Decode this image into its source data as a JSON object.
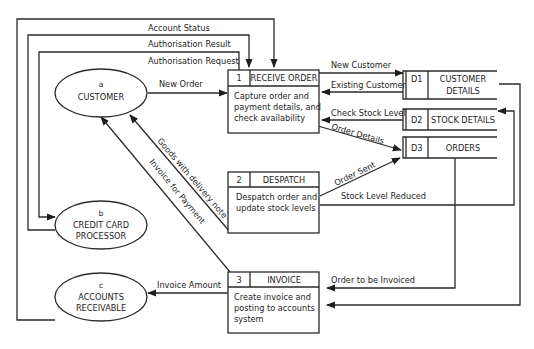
{
  "diagram": {
    "type": "data-flow-diagram",
    "external_entities": [
      {
        "id": "a",
        "name": "CUSTOMER"
      },
      {
        "id": "b",
        "name_line1": "CREDIT CARD",
        "name_line2": "PROCESSOR"
      },
      {
        "id": "c",
        "name_line1": "ACCOUNTS",
        "name_line2": "RECEIVABLE"
      }
    ],
    "processes": [
      {
        "number": "1",
        "name": "RECEIVE ORDER",
        "desc_line1": "Capture order and",
        "desc_line2": "payment details, and",
        "desc_line3": "check availability"
      },
      {
        "number": "2",
        "name": "DESPATCH",
        "desc_line1": "Despatch order and",
        "desc_line2": "update stock levels"
      },
      {
        "number": "3",
        "name": "INVOICE",
        "desc_line1": "Create invoice and",
        "desc_line2": "posting to accounts",
        "desc_line3": "system"
      }
    ],
    "data_stores": [
      {
        "id": "D1",
        "name_line1": "CUSTOMER",
        "name_line2": "DETAILS"
      },
      {
        "id": "D2",
        "name": "STOCK DETAILS"
      },
      {
        "id": "D3",
        "name": "ORDERS"
      }
    ],
    "flows": {
      "account_status": "Account Status",
      "authorisation_result": "Authorisation Result",
      "authorisation_request": "Authorisation Request",
      "new_order": "New Order",
      "new_customer": "New Customer",
      "existing_customer": "Existing Customer",
      "check_stock_level": "Check Stock Level",
      "order_details": "Order Details",
      "goods_with_delivery_note": "Goods with delivery note",
      "invoice_for_payment": "Invoice for Payment",
      "order_sent": "Order Sent",
      "stock_level_reduced": "Stock Level Reduced",
      "order_to_be_invoiced": "Order to be Invoiced",
      "invoice_amount": "Invoice Amount"
    }
  }
}
